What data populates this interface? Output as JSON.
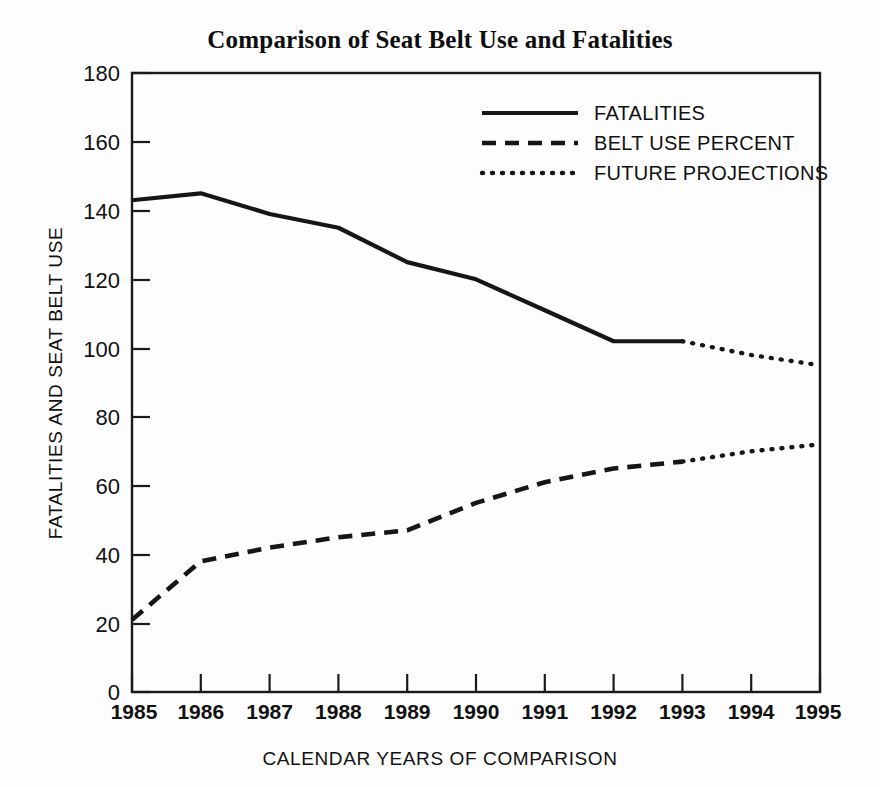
{
  "chart_data": {
    "type": "line",
    "title": "Comparison of Seat Belt Use and Fatalities",
    "xlabel": "CALENDAR YEARS OF COMPARISON",
    "ylabel": "FATALITIES AND SEAT BELT USE",
    "x": [
      1985,
      1986,
      1987,
      1988,
      1989,
      1990,
      1991,
      1992,
      1993,
      1994,
      1995
    ],
    "xtick_labels": [
      "1985",
      "1986",
      "1987",
      "1988",
      "1989",
      "1990",
      "1991",
      "1992",
      "1993",
      "1994",
      "1995"
    ],
    "ytick_labels": [
      "0",
      "20",
      "40",
      "60",
      "80",
      "100",
      "120",
      "140",
      "160",
      "180"
    ],
    "yticks": [
      0,
      20,
      40,
      60,
      80,
      100,
      120,
      140,
      160,
      180
    ],
    "ylim": [
      0,
      180
    ],
    "xlim": [
      1985,
      1995
    ],
    "grid": false,
    "legend_position": "upper-right-inside",
    "series": [
      {
        "name": "FATALITIES",
        "style": "solid",
        "x": [
          1985,
          1986,
          1987,
          1988,
          1989,
          1990,
          1991,
          1992,
          1993
        ],
        "values": [
          143,
          145,
          139,
          135,
          125,
          120,
          111,
          102,
          102
        ]
      },
      {
        "name": "BELT USE PERCENT",
        "style": "dashed",
        "x": [
          1985,
          1986,
          1987,
          1988,
          1989,
          1990,
          1991,
          1992,
          1993
        ],
        "values": [
          21,
          38,
          42,
          45,
          47,
          55,
          61,
          65,
          67
        ]
      },
      {
        "name": "FUTURE PROJECTIONS",
        "style": "dotted",
        "segments": [
          {
            "of": "FATALITIES",
            "x": [
              1993,
              1994,
              1995
            ],
            "values": [
              102,
              98,
              95
            ]
          },
          {
            "of": "BELT USE PERCENT",
            "x": [
              1993,
              1994,
              1995
            ],
            "values": [
              67,
              70,
              72
            ]
          }
        ]
      }
    ],
    "legend": [
      {
        "label": "FATALITIES",
        "style": "solid"
      },
      {
        "label": "BELT USE PERCENT",
        "style": "dashed"
      },
      {
        "label": "FUTURE PROJECTIONS",
        "style": "dotted"
      }
    ],
    "colors": {
      "line": "#161616",
      "axis": "#1a1a1a",
      "background": "#fdfdfd",
      "text": "#111111"
    }
  }
}
